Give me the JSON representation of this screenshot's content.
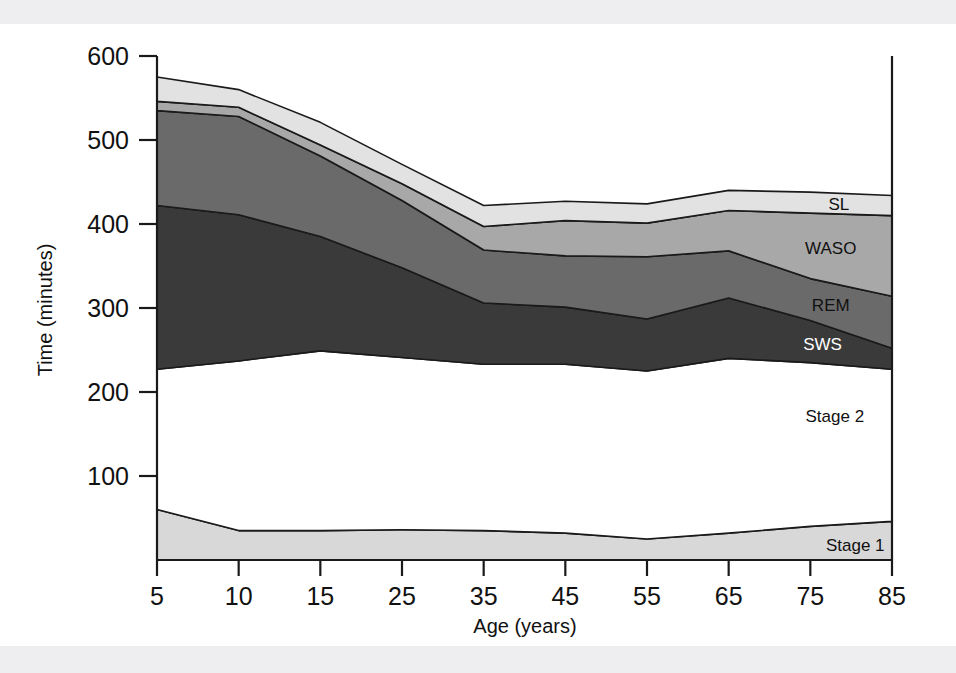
{
  "figure": {
    "background_color": "#ffffff",
    "scan_band_color": "#eeeef0",
    "axis_color": "#1a1a1a"
  },
  "chart_data": {
    "type": "area",
    "title": "",
    "subtitle": "",
    "xlabel": "Age (years)",
    "ylabel": "Time (minutes)",
    "x": [
      5,
      10,
      15,
      25,
      35,
      45,
      55,
      65,
      75,
      85
    ],
    "xtick_labels": [
      "5",
      "10",
      "15",
      "25",
      "35",
      "45",
      "55",
      "65",
      "75",
      "85"
    ],
    "ytick_labels": [
      "100",
      "200",
      "300",
      "400",
      "500",
      "600"
    ],
    "ytick_values": [
      100,
      200,
      300,
      400,
      500,
      600
    ],
    "ylim": [
      0,
      600
    ],
    "xlim_categorical": true,
    "grid": false,
    "legend_position": "inline-right",
    "stacking": "cumulative-from-bottom",
    "series": [
      {
        "name": "Stage 1",
        "label": "Stage 1",
        "color": "#d8d8d8",
        "label_color": "#111111",
        "values": [
          60,
          35,
          35,
          36,
          35,
          32,
          25,
          32,
          40,
          46
        ]
      },
      {
        "name": "Stage 2",
        "label": "Stage 2",
        "color": "#ffffff",
        "label_color": "#111111",
        "values": [
          167,
          202,
          214,
          205,
          198,
          201,
          200,
          208,
          195,
          181
        ]
      },
      {
        "name": "SWS",
        "label": "SWS",
        "color": "#3a3a3a",
        "label_color": "#ffffff",
        "values": [
          195,
          174,
          136,
          107,
          73,
          68,
          62,
          72,
          50,
          25
        ]
      },
      {
        "name": "REM",
        "label": "REM",
        "color": "#6a6a6a",
        "label_color": "#111111",
        "values": [
          113,
          117,
          96,
          80,
          63,
          61,
          74,
          56,
          50,
          62
        ]
      },
      {
        "name": "WASO",
        "label": "WASO",
        "color": "#a8a8a8",
        "label_color": "#111111",
        "values": [
          11,
          11,
          13,
          20,
          28,
          42,
          40,
          48,
          78,
          96
        ]
      },
      {
        "name": "SL",
        "label": "SL",
        "color": "#e2e2e2",
        "label_color": "#111111",
        "values": [
          29,
          21,
          27,
          23,
          25,
          23,
          23,
          24,
          25,
          24
        ]
      }
    ]
  }
}
